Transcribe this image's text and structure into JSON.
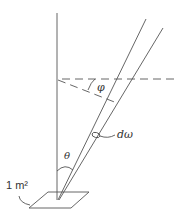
{
  "diagram": {
    "type": "solid-angle-geometry",
    "labels": {
      "phi": "φ",
      "d_omega": "dω",
      "theta": "θ",
      "area": "1 m²"
    },
    "colors": {
      "stroke": "#555555",
      "text": "#333333",
      "background": "#ffffff"
    }
  }
}
